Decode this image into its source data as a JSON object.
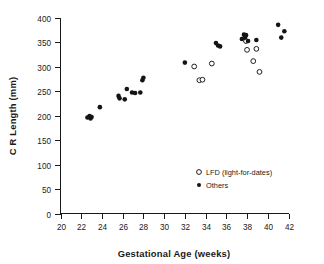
{
  "chart_data": {
    "type": "scatter",
    "title": "",
    "xlabel": "Gestational Age (weeks)",
    "ylabel": "C R Length (mm)",
    "xlim": [
      20,
      42
    ],
    "ylim": [
      0,
      400
    ],
    "xticks": [
      20,
      22,
      24,
      26,
      28,
      30,
      32,
      34,
      36,
      38,
      40,
      42
    ],
    "yticks": [
      0,
      50,
      100,
      150,
      200,
      250,
      300,
      350,
      400
    ],
    "grid": false,
    "legend_position": "inside-lower-right",
    "series": [
      {
        "name": "LFD (light-for-dates)",
        "marker": "open-circle",
        "color": "#141414",
        "points": [
          [
            32.9,
            300
          ],
          [
            33.4,
            272
          ],
          [
            33.7,
            273
          ],
          [
            34.6,
            306
          ],
          [
            37.9,
            352
          ],
          [
            38.0,
            334
          ],
          [
            38.6,
            311
          ],
          [
            38.9,
            336
          ],
          [
            39.2,
            289
          ]
        ]
      },
      {
        "name": "Others",
        "marker": "filled-circle",
        "color": "#141414",
        "points": [
          [
            22.6,
            196
          ],
          [
            22.8,
            199
          ],
          [
            22.9,
            194
          ],
          [
            23.0,
            197
          ],
          [
            23.8,
            217
          ],
          [
            25.6,
            240
          ],
          [
            25.7,
            235
          ],
          [
            26.2,
            233
          ],
          [
            26.4,
            254
          ],
          [
            26.9,
            247
          ],
          [
            27.2,
            246
          ],
          [
            27.7,
            247
          ],
          [
            27.9,
            272
          ],
          [
            28.0,
            277
          ],
          [
            32.0,
            308
          ],
          [
            35.0,
            348
          ],
          [
            35.2,
            343
          ],
          [
            35.4,
            341
          ],
          [
            37.5,
            356
          ],
          [
            37.7,
            365
          ],
          [
            37.8,
            359
          ],
          [
            37.9,
            364
          ],
          [
            38.1,
            352
          ],
          [
            38.9,
            354
          ],
          [
            41.0,
            385
          ],
          [
            41.3,
            359
          ],
          [
            41.6,
            372
          ]
        ]
      }
    ]
  },
  "legend": {
    "entries": [
      {
        "label": "LFD (light-for-dates)",
        "marker": "open-circle"
      },
      {
        "label": "Others",
        "marker": "filled-circle"
      }
    ]
  }
}
